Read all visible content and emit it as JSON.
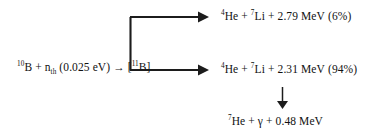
{
  "diagram": {
    "reactant": {
      "nucleus_mass": "10",
      "nucleus_symbol": "B",
      "plus_1": " + ",
      "neutron_symbol": "n",
      "neutron_subscript": "th",
      "neutron_energy": " (0.025 eV)",
      "reaction_arrow": " → ",
      "compound_nucleus": "[",
      "compound_mass": "11",
      "compound_symbol": "B",
      "compound_close": "]",
      "full_text": "10B + nth (0.025 eV) → [11B]"
    },
    "branch_upper": {
      "he_mass": "4",
      "he_symbol": "He",
      "plus_1": " + ",
      "li_mass": "7",
      "li_symbol": "Li",
      "plus_2": " + ",
      "energy": "2.79 MeV",
      "branching_ratio": "(6%)",
      "full_text": "4He + 7Li + 2.79 MeV (6%)"
    },
    "branch_lower": {
      "he_mass": "4",
      "he_symbol": "He",
      "plus_1": " + ",
      "li_mass": "7",
      "li_symbol": "Li",
      "plus_2": " + ",
      "energy": "2.31 MeV",
      "branching_ratio": "(94%)",
      "full_text": "4He + 7Li + 2.31 MeV (94%)"
    },
    "decay": {
      "he_mass": "7",
      "he_symbol": "He",
      "plus_1": " + ",
      "gamma_symbol": "γ",
      "plus_2": " + ",
      "energy": "0.48 MeV",
      "full_text": "7He + γ + 0.48 MeV"
    },
    "colors": {
      "stroke": "#1c1c1c",
      "text": "#111111",
      "background": "#ffffff"
    },
    "icons": {
      "branch_split": "branch-split-arrows-icon",
      "decay_arrow": "down-arrow-icon",
      "reaction_arrow": "right-arrow-glyph"
    }
  }
}
